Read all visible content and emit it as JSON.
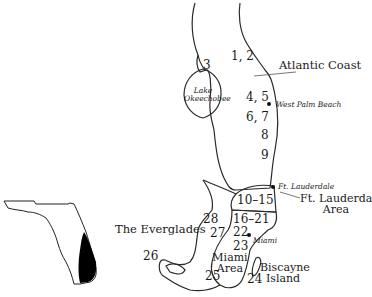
{
  "map": {
    "title": "South Florida dive regions",
    "regions": [
      {
        "id": "atlantic-coast",
        "label": "Atlantic Coast"
      },
      {
        "id": "ft-lauderdale-area",
        "label_line1": "Ft. Lauderdale",
        "label_line2": "Area"
      },
      {
        "id": "the-everglades",
        "label": "The Everglades"
      },
      {
        "id": "miami-area",
        "label_line1": "Miami",
        "label_line2": "Area"
      },
      {
        "id": "biscayne-island",
        "label_line1": "Biscayne",
        "label_line2": "Island"
      }
    ],
    "lake": {
      "label_line1": "Lake",
      "label_line2": "Okeechobee"
    },
    "cities": [
      {
        "name": "West Palm Beach"
      },
      {
        "name": "Ft. Lauderdale"
      },
      {
        "name": "Miami"
      }
    ],
    "site_numbers": [
      "1, 2",
      "3",
      "4, 5",
      "6, 7",
      "8",
      "9",
      "10–15",
      "16–21",
      "22",
      "23",
      "24",
      "25",
      "26",
      "27",
      "28"
    ],
    "inset": {
      "description": "Florida state outline with South Florida highlighted",
      "highlight_color": "#000000"
    },
    "colors": {
      "line": "#2a2a2a",
      "background": "#ffffff"
    }
  }
}
